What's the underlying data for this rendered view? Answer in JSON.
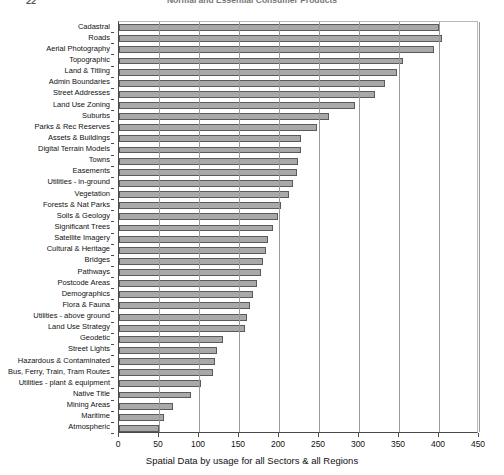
{
  "page": {
    "page_number": "22",
    "title_clipped": "Normal and Essential Consumer Products"
  },
  "chart_data": {
    "type": "bar",
    "orientation": "horizontal",
    "title": "",
    "xlabel": "Spatial Data by usage for all Sectors & all Regions",
    "ylabel": "",
    "xlim": [
      0,
      450
    ],
    "xticks": [
      0,
      50,
      100,
      150,
      200,
      250,
      300,
      350,
      400,
      450
    ],
    "grid": true,
    "legend": false,
    "categories": [
      "Cadastral",
      "Roads",
      "Aerial Photography",
      "Topographic",
      "Land & Titling",
      "Admin Boundaries",
      "Street Addresses",
      "Land Use Zoning",
      "Suburbs",
      "Parks & Rec Reserves",
      "Assets & Buildings",
      "Digital Terrain Models",
      "Towns",
      "Easements",
      "Utilities - in-ground",
      "Vegetation",
      "Forests & Nat Parks",
      "Soils & Geology",
      "Significant Trees",
      "Satellite Imagery",
      "Cultural & Heritage",
      "Bridges",
      "Pathways",
      "Postcode Areas",
      "Demographics",
      "Flora & Fauna",
      "Utilities - above ground",
      "Land Use Strategy",
      "Geodetic",
      "Street Lights",
      "Hazardous & Contaminated",
      "Bus, Ferry, Train, Tram Routes",
      "Utilities - plant & equipment",
      "Native Title",
      "Mining Areas",
      "Maritime",
      "Atmospheric"
    ],
    "values": [
      400,
      404,
      394,
      355,
      347,
      332,
      320,
      295,
      262,
      248,
      228,
      227,
      224,
      222,
      218,
      213,
      203,
      199,
      192,
      186,
      184,
      180,
      177,
      172,
      168,
      164,
      160,
      157,
      130,
      123,
      120,
      117,
      103,
      90,
      68,
      56,
      50
    ]
  }
}
